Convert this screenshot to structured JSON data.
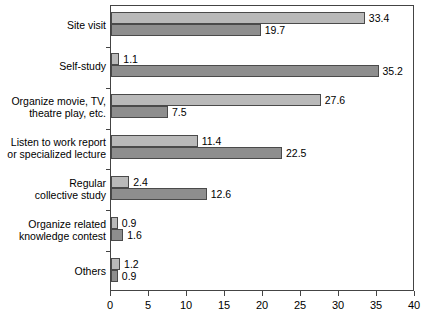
{
  "chart_data": {
    "type": "bar",
    "orientation": "horizontal",
    "title": "",
    "xlabel": "",
    "ylabel": "",
    "xlim": [
      0,
      40
    ],
    "xticks": [
      0,
      5,
      10,
      15,
      20,
      25,
      30,
      35,
      40
    ],
    "grid": false,
    "legend": "none",
    "categories": [
      "Site visit",
      "Self-study",
      "Organize movie, TV,\ntheatre play, etc.",
      "Listen to work report\nor specialized lecture",
      "Regular\ncollective study",
      "Organize related\nknowledge contest",
      "Others"
    ],
    "series": [
      {
        "name": "series-1",
        "color": "#b9b9b9",
        "values": [
          33.4,
          1.1,
          27.6,
          11.4,
          2.4,
          0.9,
          1.2
        ],
        "labels": [
          "33.4",
          "1.1",
          "27.6",
          "11.4",
          "2.4",
          "0.9",
          "1.2"
        ]
      },
      {
        "name": "series-2",
        "color": "#8e8e8e",
        "values": [
          19.7,
          35.2,
          7.5,
          22.5,
          12.6,
          1.6,
          0.9
        ],
        "labels": [
          "19.7",
          "35.2",
          "7.5",
          "22.5",
          "12.6",
          "1.6",
          "0.9"
        ]
      }
    ]
  }
}
